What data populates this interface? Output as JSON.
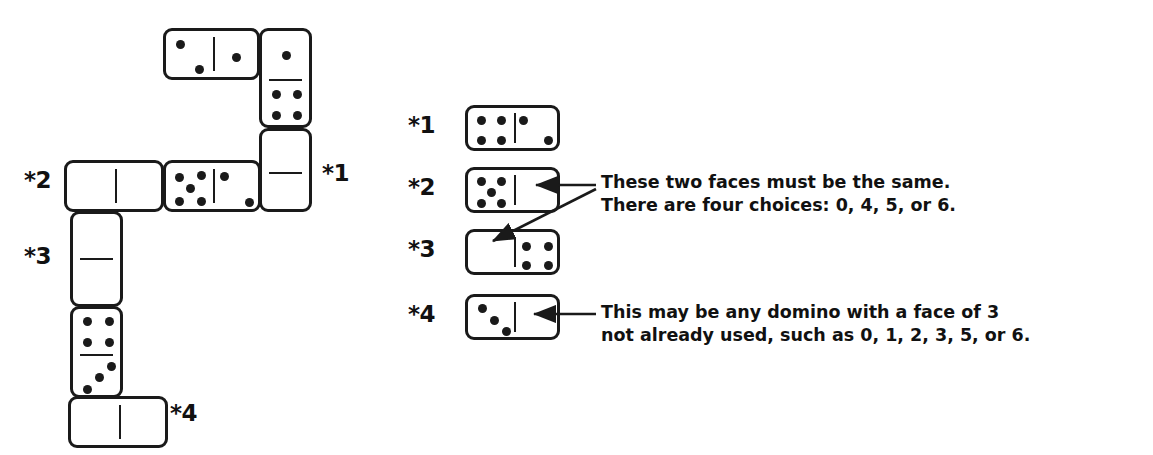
{
  "figure": {
    "type": "domino-chain-diagram",
    "ink_color": "#1a1a1a",
    "background": "#ffffff"
  },
  "left_diagram": {
    "name": "domino-chain",
    "labels": [
      {
        "id": "star1",
        "text": "*1",
        "x": 322,
        "y": 160
      },
      {
        "id": "star2",
        "text": "*2",
        "x": 24,
        "y": 167
      },
      {
        "id": "star3",
        "text": "*3",
        "x": 24,
        "y": 243
      },
      {
        "id": "star4",
        "text": "*4",
        "x": 170,
        "y": 400
      }
    ],
    "dominoes": [
      {
        "id": "chain-domino-2-1",
        "orientation": "horizontal",
        "x": 163,
        "y": 28,
        "w": 97,
        "h": 52,
        "left_face": 2,
        "right_face": 1,
        "faces_label": "2|1"
      },
      {
        "id": "chain-domino-1-4",
        "orientation": "vertical",
        "x": 259,
        "y": 28,
        "w": 53,
        "h": 100,
        "top_face": 1,
        "bottom_face": 4,
        "faces_label": "1|4"
      },
      {
        "id": "chain-domino-star1-blank",
        "orientation": "vertical",
        "x": 259,
        "y": 128,
        "w": 53,
        "h": 84,
        "top_face": 0,
        "bottom_face": 0,
        "faces_label": "blank|blank",
        "note": "*1 unknown domino"
      },
      {
        "id": "chain-domino-5-2",
        "orientation": "horizontal",
        "x": 163,
        "y": 160,
        "w": 98,
        "h": 52,
        "left_face": 5,
        "right_face": 2,
        "faces_label": "5|2"
      },
      {
        "id": "chain-domino-star2-blank",
        "orientation": "horizontal",
        "x": 64,
        "y": 160,
        "w": 100,
        "h": 52,
        "left_face": 0,
        "right_face": 0,
        "faces_label": "blank|blank",
        "note": "*2 unknown domino"
      },
      {
        "id": "chain-domino-star3-blank",
        "orientation": "vertical",
        "x": 70,
        "y": 211,
        "w": 53,
        "h": 96,
        "top_face": 0,
        "bottom_face": 0,
        "faces_label": "blank|blank",
        "note": "*3 unknown domino"
      },
      {
        "id": "chain-domino-4-3",
        "orientation": "vertical",
        "x": 70,
        "y": 306,
        "w": 53,
        "h": 92,
        "top_face": 4,
        "bottom_face": 3,
        "faces_label": "4|3"
      },
      {
        "id": "chain-domino-star4-blank",
        "orientation": "horizontal",
        "x": 68,
        "y": 396,
        "w": 100,
        "h": 52,
        "left_face": 0,
        "right_face": 0,
        "faces_label": "blank|blank",
        "note": "*4 unknown domino"
      }
    ]
  },
  "right_panel": {
    "name": "legend-panel",
    "rows": [
      {
        "id": "legend-row-1",
        "label": "*1",
        "label_x": 408,
        "label_y": 112,
        "domino": {
          "id": "legend-domino-4-2",
          "orientation": "horizontal",
          "x": 465,
          "y": 105,
          "w": 95,
          "h": 46,
          "left_face": 4,
          "right_face": 2,
          "faces_label": "4|2"
        }
      },
      {
        "id": "legend-row-2",
        "label": "*2",
        "label_x": 408,
        "label_y": 174,
        "domino": {
          "id": "legend-domino-5-blank",
          "orientation": "horizontal",
          "x": 465,
          "y": 167,
          "w": 95,
          "h": 46,
          "left_face": 5,
          "right_face": 0,
          "faces_label": "5|blank"
        }
      },
      {
        "id": "legend-row-3",
        "label": "*3",
        "label_x": 408,
        "label_y": 236,
        "domino": {
          "id": "legend-domino-blank-4",
          "orientation": "horizontal",
          "x": 465,
          "y": 229,
          "w": 95,
          "h": 46,
          "left_face": 0,
          "right_face": 4,
          "faces_label": "blank|4"
        }
      },
      {
        "id": "legend-row-4",
        "label": "*4",
        "label_x": 408,
        "label_y": 301,
        "domino": {
          "id": "legend-domino-3-blank",
          "orientation": "horizontal",
          "x": 465,
          "y": 294,
          "w": 95,
          "h": 46,
          "left_face": 3,
          "right_face": 0,
          "faces_label": "3|blank"
        }
      }
    ],
    "callouts": [
      {
        "id": "callout-same-faces",
        "line1": "These two faces must be the same.",
        "line2": "There are four choices: 0, 4, 5, or 6.",
        "x": 601,
        "y": 170,
        "arrow_targets": [
          "legend-domino-5-blank",
          "legend-domino-blank-4"
        ]
      },
      {
        "id": "callout-any-domino",
        "line1": "This may be any domino with a face of 3",
        "line2": "not already used, such as 0, 1, 2, 3, 5, or 6.",
        "x": 601,
        "y": 300,
        "arrow_targets": [
          "legend-domino-3-blank"
        ]
      }
    ]
  }
}
